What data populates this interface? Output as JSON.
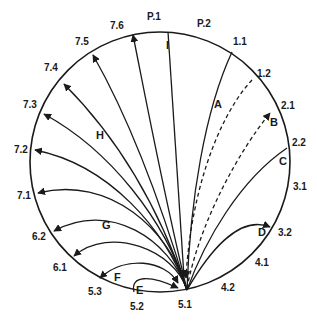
{
  "diagram": {
    "circle": {
      "cx": 160,
      "cy": 162,
      "r": 130
    },
    "convergence_point": "5.1",
    "boundary_labels": [
      {
        "text": "P.1",
        "x": 147,
        "y": 20
      },
      {
        "text": "P.2",
        "x": 197,
        "y": 27
      },
      {
        "text": "1.1",
        "x": 233,
        "y": 45
      },
      {
        "text": "1.2",
        "x": 257,
        "y": 77
      },
      {
        "text": "2.1",
        "x": 281,
        "y": 109
      },
      {
        "text": "2.2",
        "x": 292,
        "y": 146
      },
      {
        "text": "3.1",
        "x": 293,
        "y": 190
      },
      {
        "text": "3.2",
        "x": 278,
        "y": 236
      },
      {
        "text": "4.1",
        "x": 255,
        "y": 266
      },
      {
        "text": "4.2",
        "x": 221,
        "y": 291
      },
      {
        "text": "5.1",
        "x": 178,
        "y": 308
      },
      {
        "text": "5.2",
        "x": 130,
        "y": 310
      },
      {
        "text": "5.3",
        "x": 88,
        "y": 295
      },
      {
        "text": "6.1",
        "x": 53,
        "y": 271
      },
      {
        "text": "6.2",
        "x": 32,
        "y": 240
      },
      {
        "text": "7.1",
        "x": 17,
        "y": 199
      },
      {
        "text": "7.2",
        "x": 14,
        "y": 153
      },
      {
        "text": "7.3",
        "x": 23,
        "y": 108
      },
      {
        "text": "7.4",
        "x": 44,
        "y": 71
      },
      {
        "text": "7.5",
        "x": 75,
        "y": 45
      },
      {
        "text": "7.6",
        "x": 110,
        "y": 29
      }
    ],
    "curve_labels": [
      {
        "text": "I",
        "x": 166,
        "y": 49
      },
      {
        "text": "A",
        "x": 214,
        "y": 108
      },
      {
        "text": "B",
        "x": 270,
        "y": 126
      },
      {
        "text": "C",
        "x": 279,
        "y": 165
      },
      {
        "text": "D",
        "x": 258,
        "y": 236
      },
      {
        "text": "H",
        "x": 96,
        "y": 139
      },
      {
        "text": "G",
        "x": 102,
        "y": 229
      },
      {
        "text": "F",
        "x": 114,
        "y": 281
      },
      {
        "text": "E",
        "x": 136,
        "y": 294
      }
    ],
    "paths": [
      {
        "id": "I",
        "style": "solid",
        "arrow": "end",
        "d": "M168,32 L184,277"
      },
      {
        "id": "A",
        "style": "solid",
        "arrow": "none",
        "d": "M232,52 C205,110 190,200 187,290"
      },
      {
        "id": "A-dashed",
        "style": "dashed",
        "arrow": "end",
        "d": "M252,80 C215,120 190,200 186,278"
      },
      {
        "id": "B-dashed",
        "style": "dashed",
        "arrow": "end",
        "d": "M187,288 C200,220 240,150 270,113"
      },
      {
        "id": "C",
        "style": "solid",
        "arrow": "none",
        "d": "M287,148 C240,180 205,240 187,290"
      },
      {
        "id": "D",
        "style": "solid",
        "arrow": "end",
        "d": "M187,290 C210,250 240,215 270,227"
      },
      {
        "id": "I2",
        "style": "solid",
        "arrow": "end",
        "d": "M187,290 C165,200 150,120 133,35"
      },
      {
        "id": "7.5",
        "style": "solid",
        "arrow": "end",
        "d": "M187,290 C160,200 130,120 93,55"
      },
      {
        "id": "7.4",
        "style": "solid",
        "arrow": "end",
        "d": "M187,290 C160,210 120,140 64,84"
      },
      {
        "id": "7.3",
        "style": "solid",
        "arrow": "end",
        "d": "M187,290 C165,220 110,150 44,114"
      },
      {
        "id": "7.2",
        "style": "solid",
        "arrow": "end",
        "d": "M187,290 C165,230 110,165 35,150"
      },
      {
        "id": "7.1",
        "style": "solid",
        "arrow": "end",
        "d": "M187,290 C170,230 110,175 38,193"
      },
      {
        "id": "6.2",
        "style": "solid",
        "arrow": "end",
        "d": "M187,290 C170,240 110,200 54,231"
      },
      {
        "id": "6.1",
        "style": "solid",
        "arrow": "end",
        "d": "M187,290 C175,250 110,225 74,256"
      },
      {
        "id": "F",
        "style": "solid",
        "arrow": "both",
        "d": "M100,278 C125,255 165,260 178,283"
      },
      {
        "id": "E",
        "style": "solid",
        "arrow": "end",
        "d": "M134,292 C130,275 150,275 178,288"
      }
    ]
  }
}
